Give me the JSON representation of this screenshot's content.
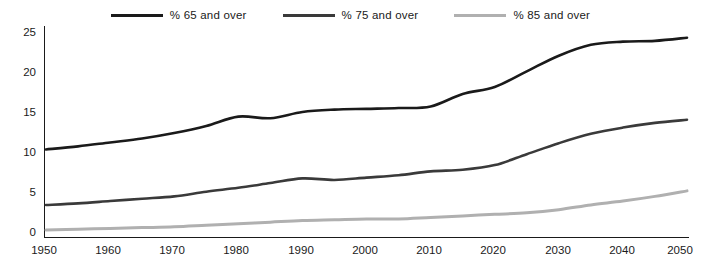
{
  "legend": {
    "items": [
      {
        "label": "% 65 and over",
        "color": "#1a1a1a"
      },
      {
        "label": "% 75 and over",
        "color": "#3a3a3a"
      },
      {
        "label": "% 85 and over",
        "color": "#b0b0b0"
      }
    ]
  },
  "axes": {
    "y_ticks": [
      "0",
      "5",
      "10",
      "15",
      "20",
      "25"
    ],
    "x_ticks": [
      "1950",
      "1960",
      "1970",
      "1980",
      "1990",
      "2000",
      "2010",
      "2020",
      "2030",
      "2040",
      "2050"
    ]
  },
  "chart_data": {
    "type": "line",
    "title": "",
    "subtitle": "",
    "xlabel": "",
    "ylabel": "",
    "xlim": [
      1950,
      2050
    ],
    "ylim": [
      0,
      27
    ],
    "grid": false,
    "legend_position": "top-center",
    "x": [
      1950,
      1955,
      1960,
      1965,
      1970,
      1975,
      1980,
      1985,
      1990,
      1995,
      2000,
      2005,
      2010,
      2015,
      2020,
      2025,
      2030,
      2035,
      2040,
      2045,
      2050
    ],
    "series": [
      {
        "name": "% 65 and over",
        "color": "#1a1a1a",
        "values": [
          11.2,
          11.6,
          12.1,
          12.6,
          13.3,
          14.2,
          15.4,
          15.2,
          16.0,
          16.3,
          16.4,
          16.5,
          16.7,
          18.3,
          19.2,
          21.2,
          23.2,
          24.6,
          25.0,
          25.1,
          25.5
        ]
      },
      {
        "name": "% 75 and over",
        "color": "#3a3a3a",
        "values": [
          4.1,
          4.3,
          4.6,
          4.9,
          5.2,
          5.8,
          6.3,
          6.9,
          7.5,
          7.3,
          7.6,
          7.9,
          8.4,
          8.6,
          9.2,
          10.6,
          12.0,
          13.2,
          14.0,
          14.6,
          15.0
        ]
      },
      {
        "name": "% 85 and over",
        "color": "#b0b0b0",
        "values": [
          0.9,
          1.0,
          1.1,
          1.2,
          1.3,
          1.5,
          1.7,
          1.9,
          2.1,
          2.2,
          2.3,
          2.3,
          2.5,
          2.7,
          2.9,
          3.1,
          3.5,
          4.1,
          4.6,
          5.2,
          5.9
        ]
      }
    ]
  }
}
